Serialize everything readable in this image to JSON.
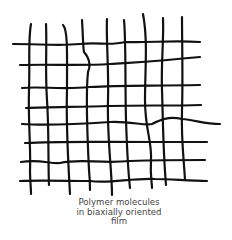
{
  "diagram": {
    "title": "Polymer molecules in biaxially oriented film",
    "caption_lines": [
      "Polymer molecules",
      "in biaxially oriented",
      "film"
    ],
    "line_color": "#111111",
    "grid": {
      "vertical_lines": 9,
      "horizontal_lines": 8
    }
  }
}
